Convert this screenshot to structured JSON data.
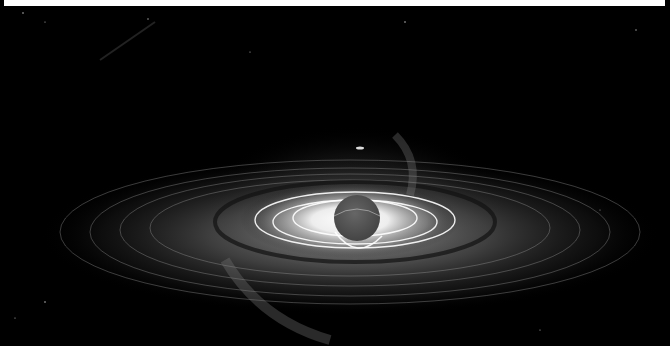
{
  "image": {
    "subject": "black hole with accretion disk",
    "palette": {
      "background": "#000000",
      "top_strip": "#ffffff",
      "core_glow": "#ffffff",
      "sphere": "#555555",
      "disk": "#888888"
    },
    "elements": {
      "top_strip": {
        "x": 4,
        "y": 0,
        "width": 661,
        "height": 6
      },
      "event_horizon": {
        "cx": 357,
        "cy": 218,
        "r": 22
      },
      "accretion_disk": {
        "cx": 350,
        "cy": 232,
        "rx": 300,
        "ry": 70
      }
    }
  }
}
